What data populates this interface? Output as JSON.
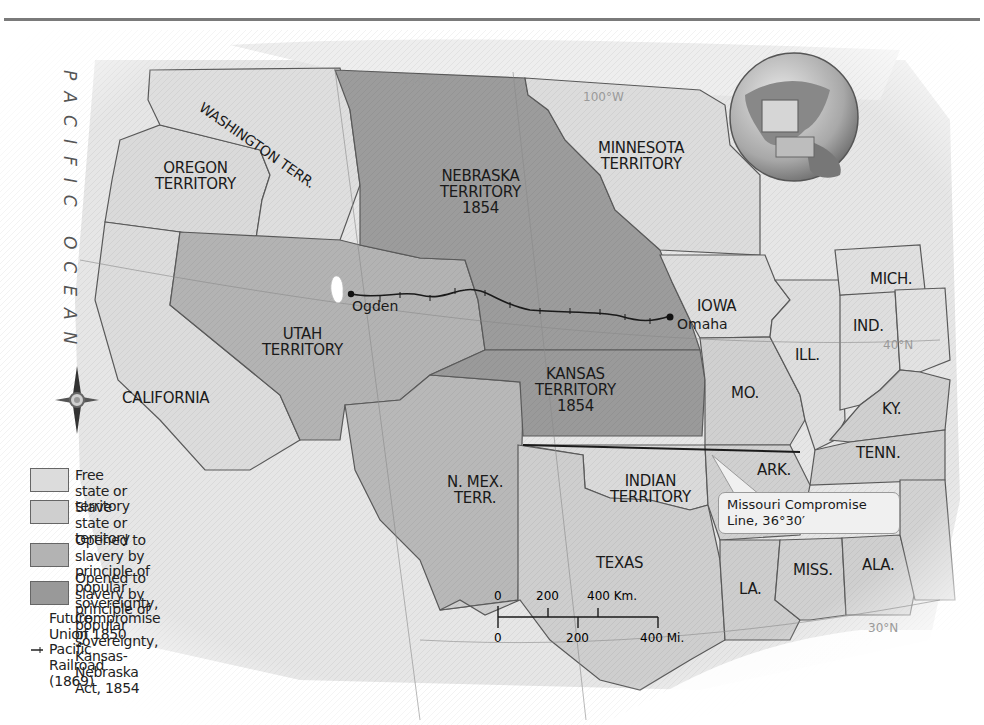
{
  "header": {
    "rule_visible": true
  },
  "map": {
    "title": "",
    "ocean_label": "PACIFIC OCEAN",
    "grid_labels": {
      "lon_110": "110°W",
      "lon_100": "100°W",
      "lat_40": "40°N",
      "lat_30": "30°N"
    },
    "regions": {
      "washington": "WASHINGTON TERR.",
      "oregon": "OREGON\nTERRITORY",
      "oregon_line1": "OREGON",
      "oregon_line2": "TERRITORY",
      "nebraska_line1": "NEBRASKA",
      "nebraska_line2": "TERRITORY",
      "nebraska_line3": "1854",
      "minnesota_line1": "MINNESOTA",
      "minnesota_line2": "TERRITORY",
      "utah_line1": "UTAH",
      "utah_line2": "TERRITORY",
      "california": "CALIFORNIA",
      "kansas_line1": "KANSAS",
      "kansas_line2": "TERRITORY",
      "kansas_line3": "1854",
      "nmex_line1": "N. MEX.",
      "nmex_line2": "TERR.",
      "indian_line1": "INDIAN",
      "indian_line2": "TERRITORY",
      "texas": "TEXAS",
      "iowa": "IOWA",
      "mo": "MO.",
      "ill": "ILL.",
      "ind": "IND.",
      "mich": "MICH.",
      "ky": "KY.",
      "tenn": "TENN.",
      "ark": "ARK.",
      "la": "LA.",
      "miss": "MISS.",
      "ala": "ALA."
    },
    "cities": {
      "ogden": "Ogden",
      "omaha": "Omaha"
    },
    "callout": {
      "line1": "Missouri Compromise",
      "line2": "Line, 36°30′"
    },
    "scale": {
      "km_0": "0",
      "km_200": "200",
      "km_400": "400 Km.",
      "mi_0": "0",
      "mi_200": "200",
      "mi_400": "400 Mi."
    },
    "compass": "compass-rose",
    "compass_n": "N"
  },
  "legend": {
    "items": [
      {
        "label": "Free state or territory",
        "color": "#dcdcdc"
      },
      {
        "label": "Slave state or territory",
        "color": "#d0d0d0"
      },
      {
        "label": "Opened to slavery by principle of popular sovereignty, Compromise of 1850",
        "line1": "Opened to slavery by principle of popular",
        "line2": "sovereignty, Compromise of 1850",
        "color": "#b4b4b4"
      },
      {
        "label": "Opened to slavery by principle of popular sovereignty, Kansas-Nebraska Act, 1854",
        "line1": "Opened to slavery by principle of popular",
        "line2": "sovereignty, Kansas-Nebraska Act, 1854",
        "color": "#989898"
      },
      {
        "label": "Future Union Pacific Railroad (1869)",
        "color": "#222222"
      }
    ]
  },
  "colors": {
    "free": "#dcdcdc",
    "slave": "#cecece",
    "c1850": "#b3b3b3",
    "kn1854": "#999999",
    "border": "#5a5a5a",
    "railroad": "#1a1a1a"
  }
}
